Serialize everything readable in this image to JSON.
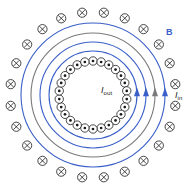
{
  "figure": {
    "name": "toroidal-solenoid-magnetic-field",
    "width": 193,
    "height": 184,
    "background": "#ffffff",
    "center": {
      "x": 93,
      "y": 95
    }
  },
  "colors": {
    "field_line_blue": "#3a5fc8",
    "field_line_gray": "#7a7a7a",
    "symbol_stroke": "#1a1a1a",
    "label_text": "#1a1a1a",
    "b_label": "#3a5fc8",
    "background": "#ffffff"
  },
  "labels": {
    "field_label": "B",
    "current_out_symbol": "I",
    "current_out_sub": "out",
    "current_in_symbol": "I",
    "current_in_sub": "in"
  },
  "chart_data": {
    "type": "diagram",
    "field_lines": [
      {
        "radius": 72,
        "color": "#3a5fc8",
        "arrow": true,
        "arrow_angle_deg": 0
      },
      {
        "radius": 62,
        "color": "#7a7a7a",
        "arrow": true,
        "arrow_angle_deg": 0
      },
      {
        "radius": 53,
        "color": "#3a5fc8",
        "arrow": true,
        "arrow_angle_deg": 0
      },
      {
        "radius": 44,
        "color": "#3a5fc8",
        "arrow": true,
        "arrow_angle_deg": 0
      }
    ],
    "inner_coil": {
      "symbol": "dot",
      "meaning": "current out of page",
      "ring_radius": 34,
      "count": 26,
      "marker_radius": 4.2
    },
    "outer_coil": {
      "symbol": "cross",
      "meaning": "current into page",
      "ring_radius": 83,
      "count": 24,
      "marker_radius": 4.6
    },
    "annotations": [
      {
        "text": "B",
        "x": 166,
        "y": 28,
        "color": "#3a5fc8"
      },
      {
        "text": "I_out",
        "x": 101,
        "y": 86,
        "color": "#1a1a1a"
      },
      {
        "text": "I_in",
        "x": 175,
        "y": 91,
        "color": "#1a1a1a"
      }
    ]
  }
}
